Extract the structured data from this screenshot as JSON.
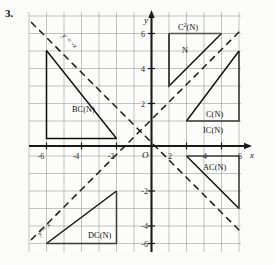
{
  "figure": {
    "problem_number": "3.",
    "axes": {
      "x_axis_label": "x",
      "y_axis_label": "y",
      "origin_label": "O",
      "x_ticks": [
        "-6",
        "-4",
        "-2",
        "2",
        "4",
        "6"
      ],
      "x_tick_values": [
        -6,
        -4,
        -2,
        2,
        4,
        6
      ],
      "y_ticks": [
        "6",
        "4",
        "2",
        "-2",
        "-4",
        "-6"
      ],
      "y_tick_values": [
        6,
        4,
        2,
        -2,
        -4,
        -6
      ],
      "xlim": [
        -7,
        7
      ],
      "ylim": [
        -7,
        7
      ],
      "grid": true,
      "grid_step": 1
    },
    "reference_lines": [
      {
        "name": "y-equals-x",
        "label": "y = x",
        "style": "dashed",
        "slope": 1,
        "intercept": 0
      },
      {
        "name": "y-equals-minus-x",
        "label": "y = -x",
        "style": "dashed",
        "slope": -1,
        "intercept": 0
      }
    ],
    "regions": [
      {
        "id": "bc-n",
        "label": "BC(N)",
        "quadrant": "II",
        "label_x": -4.55,
        "label_y": 2.52
      },
      {
        "id": "c2-n",
        "label": "C²(N)",
        "quadrant": "I",
        "label_x": 2.35,
        "label_y": 6.55
      },
      {
        "id": "n",
        "label": "N",
        "quadrant": "I",
        "label_x": 2.35,
        "label_y": 5.25
      },
      {
        "id": "c-n",
        "label": "C(N)",
        "quadrant": "I",
        "label_x": 4.15,
        "label_y": 2.35
      },
      {
        "id": "ic-n",
        "label": "IC(N)",
        "quadrant": "I",
        "label_x": 3.95,
        "label_y": 1.08
      },
      {
        "id": "ac-n",
        "label": "AC(N)",
        "quadrant": "IV",
        "label_x": 4.15,
        "label_y": -1.45
      },
      {
        "id": "dc-n",
        "label": "DC(N)",
        "quadrant": "III",
        "label_x": -3.55,
        "label_y": -5.35
      }
    ],
    "shapes": {
      "bc_n_triangle": {
        "points": "-6,5 -6,2 -2,2",
        "description": "right triangle upper-left, hypotenuse slope -1"
      },
      "c2_n_triangle": {
        "points": "1,6 6,6 1,3",
        "description": "triangle top-right with hypotenuse slope 1"
      },
      "c_n_triangle": {
        "points": "6,5 6,1 3,1",
        "description": "triangle right, hypotenuse slope 1"
      },
      "ac_n_triangle": {
        "points": "3,-1 6,-1 6,-5",
        "description": "triangle lower-right, hypotenuse slope -1"
      },
      "dc_n_triangle": {
        "points": "-6,-6 -2,-6 -2,-3",
        "description": "triangle lower-left, hypotenuse slope 1"
      }
    }
  }
}
